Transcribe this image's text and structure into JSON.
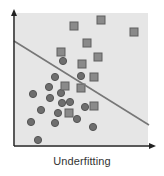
{
  "caption": "Underfitting",
  "colors": {
    "background": "#e6e6e6",
    "axis": "#222222",
    "line": "#777777",
    "circle_fill": "#6e6e6e",
    "circle_stroke": "#555555",
    "square_fill": "#8a8a8a",
    "square_stroke": "#5e5e5e"
  },
  "plot_area": {
    "x": 15,
    "y": 13,
    "width": 133,
    "height": 132
  },
  "axes": {
    "origin": [
      14,
      146
    ],
    "y_arrow_tip": [
      14,
      9
    ],
    "x_arrow_tip": [
      156,
      146
    ]
  },
  "chart_data": {
    "type": "scatter",
    "title": "Underfitting",
    "xlabel": "",
    "ylabel": "",
    "grid": false,
    "series": [
      {
        "name": "class-circle",
        "marker": "circle",
        "points": [
          [
            63,
            61
          ],
          [
            55,
            77
          ],
          [
            81,
            76
          ],
          [
            49,
            87
          ],
          [
            33,
            94
          ],
          [
            61,
            93
          ],
          [
            50,
            98
          ],
          [
            62,
            103
          ],
          [
            70,
            102
          ],
          [
            41,
            110
          ],
          [
            58,
            113
          ],
          [
            85,
            107
          ],
          [
            31,
            122
          ],
          [
            55,
            123
          ],
          [
            77,
            119
          ],
          [
            93,
            127
          ],
          [
            38,
            140
          ]
        ]
      },
      {
        "name": "class-square",
        "marker": "square",
        "points": [
          [
            74,
            26
          ],
          [
            101,
            20
          ],
          [
            134,
            32
          ],
          [
            87,
            43
          ],
          [
            61,
            52
          ],
          [
            98,
            57
          ],
          [
            82,
            64
          ],
          [
            94,
            77
          ],
          [
            65,
            86
          ],
          [
            81,
            88
          ],
          [
            94,
            106
          ],
          [
            69,
            113
          ]
        ]
      }
    ],
    "decision_boundary": {
      "x1": 14,
      "y1": 41,
      "x2": 149,
      "y2": 125
    }
  }
}
